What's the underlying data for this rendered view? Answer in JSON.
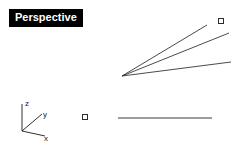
{
  "viewport": {
    "title": "Perspective",
    "background_color": "#ffffff",
    "geometry_color": "#2b2b2b",
    "title_background": "#000000",
    "title_color": "#ffffff"
  },
  "axis_gizmo": {
    "name": "world-axes-icon",
    "origin": {
      "x": 22,
      "y": 131
    },
    "axes": [
      {
        "label": "z",
        "end": {
          "x": 22,
          "y": 104
        },
        "label_pos": {
          "x": 25,
          "y": 105
        }
      },
      {
        "label": "y",
        "end": {
          "x": 42,
          "y": 114
        },
        "label_pos": {
          "x": 43,
          "y": 116
        }
      },
      {
        "label": "x",
        "end": {
          "x": 45,
          "y": 136
        },
        "label_pos": {
          "x": 44,
          "y": 139
        }
      }
    ]
  },
  "geometry": {
    "vertex": {
      "x": 122,
      "y": 76
    },
    "lines": [
      {
        "name": "ray-upper",
        "x1": 122,
        "y1": 76,
        "x2": 207,
        "y2": 25
      },
      {
        "name": "ray-middle",
        "x1": 122,
        "y1": 76,
        "x2": 229,
        "y2": 33
      },
      {
        "name": "ray-lower",
        "x1": 122,
        "y1": 76,
        "x2": 231,
        "y2": 62
      },
      {
        "name": "horizontal-line",
        "x1": 118,
        "y1": 118,
        "x2": 212,
        "y2": 118
      }
    ],
    "points": [
      {
        "name": "control-point-upper-right",
        "x": 221,
        "y": 21,
        "size": 5
      },
      {
        "name": "control-point-lower-left",
        "x": 85,
        "y": 117,
        "size": 5
      }
    ]
  }
}
